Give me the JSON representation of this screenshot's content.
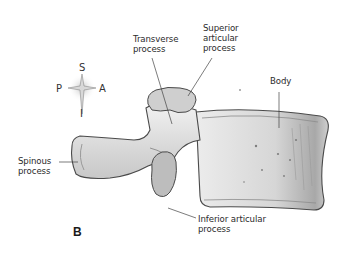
{
  "figure": {
    "panel_label": "B",
    "colors": {
      "background": "#ffffff",
      "bone_fill": "#d9d9d9",
      "bone_highlight": "#efefef",
      "bone_outline": "#4a4a4a",
      "articular_fill": "#bdbdbd",
      "leader_line": "#444444",
      "text": "#2b2b2b"
    }
  },
  "compass": {
    "superior": "S",
    "inferior": "I",
    "posterior": "P",
    "anterior": "A"
  },
  "labels": {
    "transverse_process": "Transverse\nprocess",
    "superior_articular_process": "Superior\narticular\nprocess",
    "body": "Body",
    "spinous_process": "Spinous\nprocess",
    "inferior_articular_process": "Inferior articular\nprocess"
  }
}
